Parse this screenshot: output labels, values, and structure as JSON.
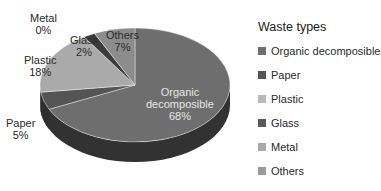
{
  "chart_data": {
    "type": "pie",
    "title": "",
    "style": "3d",
    "legend_title": "Waste types",
    "legend_position": "right",
    "categories": [
      "Organic decomposible",
      "Paper",
      "Plastic",
      "Glass",
      "Metal",
      "Others"
    ],
    "values": [
      68,
      5,
      18,
      2,
      0,
      7
    ],
    "unit": "%",
    "colors": [
      "#6e6e6e",
      "#545454",
      "#aaaaaa",
      "#3c3c3c",
      "#c8c8c8",
      "#8c8c8c"
    ],
    "labels": [
      {
        "name": "Organic decomposible",
        "text_line1": "Organic",
        "text_line2": "decomposible",
        "pct": "68%"
      },
      {
        "name": "Paper",
        "pct": "5%"
      },
      {
        "name": "Plastic",
        "pct": "18%"
      },
      {
        "name": "Glass",
        "pct": "2%"
      },
      {
        "name": "Metal",
        "pct": "0%"
      },
      {
        "name": "Others",
        "pct": "7%"
      }
    ]
  },
  "legend": {
    "title": "Waste types",
    "items": [
      {
        "label": "Organic decomposible",
        "color": "#6e6e6e"
      },
      {
        "label": "Paper",
        "color": "#545454"
      },
      {
        "label": "Plastic",
        "color": "#b9b9b9"
      },
      {
        "label": "Glass",
        "color": "#5a5a5a"
      },
      {
        "label": "Metal",
        "color": "#a8a8a8"
      },
      {
        "label": "Others",
        "color": "#9a9a9a"
      }
    ]
  }
}
